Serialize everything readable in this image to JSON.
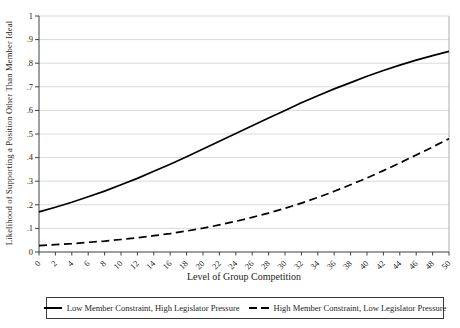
{
  "chart": {
    "y_axis_title": "Likelihood of Supporting a Position Other Than Member Ideal",
    "x_axis_title": "Level of Group Competition",
    "legend": [
      {
        "label": "Low Member Constraint, High Legislator Pressure",
        "style": "solid"
      },
      {
        "label": "High Member Constraint, Low Legislator Pressure",
        "style": "dashed"
      }
    ],
    "colors": {
      "line": "#000000",
      "grid": "#d9d9d9",
      "axis": "#404040",
      "plot_border": "#adadad",
      "text": "#1c1c1c",
      "background": "#ffffff"
    }
  },
  "chart_data": {
    "type": "line",
    "title": "",
    "xlabel": "Level of Group Competition",
    "ylabel": "Likelihood of Supporting a Position Other Than Member Ideal",
    "xlim": [
      0,
      50
    ],
    "ylim": [
      0,
      1
    ],
    "grid": "horizontal",
    "legend_position": "bottom",
    "x": [
      0,
      2,
      4,
      6,
      8,
      10,
      12,
      14,
      16,
      18,
      20,
      22,
      24,
      26,
      28,
      30,
      32,
      34,
      36,
      38,
      40,
      42,
      44,
      46,
      48,
      50
    ],
    "y_tick_labels": [
      "0",
      ".1",
      ".2",
      ".3",
      ".4",
      ".5",
      ".6",
      ".7",
      ".8",
      ".9",
      "1"
    ],
    "series": [
      {
        "name": "Low Member Constraint, High Legislator Pressure",
        "style": "solid",
        "values": [
          0.17,
          0.19,
          0.211,
          0.234,
          0.258,
          0.285,
          0.312,
          0.342,
          0.372,
          0.404,
          0.436,
          0.469,
          0.502,
          0.535,
          0.568,
          0.6,
          0.632,
          0.662,
          0.691,
          0.718,
          0.745,
          0.769,
          0.792,
          0.813,
          0.832,
          0.85
        ]
      },
      {
        "name": "High Member Constraint, Low Legislator Pressure",
        "style": "dashed",
        "values": [
          0.027,
          0.031,
          0.035,
          0.041,
          0.046,
          0.053,
          0.06,
          0.069,
          0.078,
          0.089,
          0.101,
          0.115,
          0.13,
          0.147,
          0.165,
          0.185,
          0.207,
          0.231,
          0.257,
          0.285,
          0.314,
          0.345,
          0.377,
          0.411,
          0.445,
          0.48
        ]
      }
    ]
  }
}
